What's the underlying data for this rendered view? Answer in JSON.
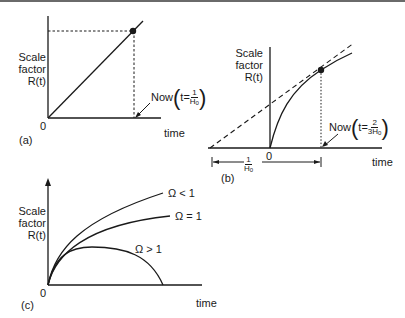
{
  "panels": {
    "a": {
      "tag": "(a)",
      "ylabel": [
        "Scale",
        "factor",
        "R(t)"
      ],
      "xlabel": "time",
      "origin": "0",
      "annotation": {
        "prefix": "Now",
        "t_eq": "t=",
        "num": "1",
        "den": "H",
        "den_sub": "0"
      }
    },
    "b": {
      "tag": "(b)",
      "ylabel": [
        "Scale",
        "factor",
        "R(t)"
      ],
      "xlabel": "time",
      "origin": "0",
      "annotation": {
        "prefix": "Now",
        "t_eq": "t=",
        "num": "2",
        "den": "3H",
        "den_sub": "0"
      },
      "interval": {
        "num": "1",
        "den": "H",
        "den_sub": "0"
      }
    },
    "c": {
      "tag": "(c)",
      "ylabel": [
        "Scale",
        "factor",
        "R(t)"
      ],
      "xlabel": "time",
      "origin": "0",
      "curves": [
        {
          "label": "Ω < 1"
        },
        {
          "label": "Ω = 1"
        },
        {
          "label": "Ω > 1"
        }
      ]
    }
  },
  "colors": {
    "line": "#1a1a1a",
    "background": "#ffffff"
  }
}
